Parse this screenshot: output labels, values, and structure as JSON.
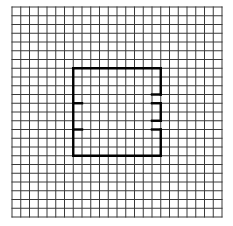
{
  "diagram": {
    "type": "grid-with-outline",
    "background": "#ffffff",
    "grid": {
      "columns": 24,
      "rows": 24,
      "origin_x": 12,
      "origin_y": 7,
      "cell_size": 8.75,
      "line_color": "#3a3a3a",
      "line_width": 1
    },
    "outline": {
      "color": "#000000",
      "line_width": 2.4,
      "bounds": {
        "left": 7,
        "top": 7,
        "right": 17,
        "bottom": 17
      },
      "segments": [
        [
          7,
          7,
          17,
          7
        ],
        [
          7,
          17,
          17,
          17
        ],
        [
          7,
          7,
          7,
          17
        ],
        [
          7,
          11,
          8,
          11
        ],
        [
          7,
          14,
          8,
          14
        ],
        [
          17,
          7,
          17,
          10
        ],
        [
          17,
          10,
          16,
          10
        ],
        [
          16,
          11,
          17,
          11
        ],
        [
          17,
          11,
          17,
          13
        ],
        [
          17,
          13,
          16,
          13
        ],
        [
          16,
          14,
          17,
          14
        ],
        [
          17,
          14,
          17,
          17
        ]
      ]
    }
  }
}
